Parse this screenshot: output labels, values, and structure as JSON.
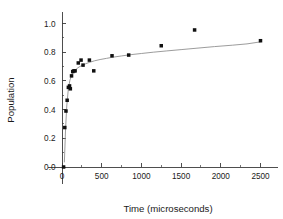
{
  "chart_data": {
    "type": "scatter",
    "title": "",
    "xlabel": "Time (microseconds)",
    "ylabel": "Population",
    "xlim": [
      -180,
      2720
    ],
    "ylim": [
      -0.12,
      1.08
    ],
    "grid": false,
    "legend": null,
    "x_ticks": [
      0,
      500,
      1000,
      1500,
      2000,
      2500
    ],
    "x_tick_labels": [
      "0",
      "500",
      "1000",
      "1500",
      "2000",
      "2500"
    ],
    "x_minor_step": 250,
    "y_ticks": [
      0.0,
      0.2,
      0.4,
      0.6,
      0.8,
      1.0
    ],
    "y_tick_labels": [
      "0.0",
      "0.2",
      "0.4",
      "0.6",
      "0.8",
      "1.0"
    ],
    "y_minor_step": 0.1,
    "marker_style": "filled-square",
    "marker_color": "#101010",
    "fit_line_color": "#8a8a8a",
    "series": [
      {
        "name": "Population data",
        "x": [
          20,
          35,
          50,
          65,
          80,
          95,
          105,
          120,
          135,
          150,
          165,
          205,
          240,
          265,
          345,
          400,
          630,
          840,
          1250,
          1670,
          2500
        ],
        "y": [
          0.0,
          0.275,
          0.39,
          0.465,
          0.555,
          0.565,
          0.545,
          0.635,
          0.665,
          0.67,
          0.67,
          0.725,
          0.745,
          0.71,
          0.745,
          0.67,
          0.775,
          0.78,
          0.845,
          0.955,
          0.88
        ]
      }
    ],
    "fit_curve": {
      "name": "fitted saturation curve",
      "x": [
        30,
        45,
        60,
        80,
        100,
        125,
        150,
        180,
        215,
        255,
        300,
        350,
        410,
        480,
        560,
        650,
        750,
        870,
        1000,
        1150,
        1320,
        1500,
        1700,
        1920,
        2150,
        2330,
        2500
      ],
      "y": [
        0.035,
        0.265,
        0.425,
        0.545,
        0.605,
        0.645,
        0.665,
        0.683,
        0.697,
        0.709,
        0.72,
        0.73,
        0.74,
        0.749,
        0.757,
        0.766,
        0.774,
        0.783,
        0.791,
        0.8,
        0.809,
        0.818,
        0.828,
        0.839,
        0.849,
        0.858,
        0.872
      ]
    }
  }
}
